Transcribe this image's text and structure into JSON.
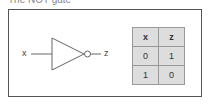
{
  "title": "The NOT gate",
  "gate": {
    "type": "NOT",
    "input_label": "x",
    "output_label": "z"
  },
  "truth_table": {
    "headers": [
      "x",
      "z"
    ],
    "rows": [
      [
        "0",
        "1"
      ],
      [
        "1",
        "0"
      ]
    ]
  }
}
